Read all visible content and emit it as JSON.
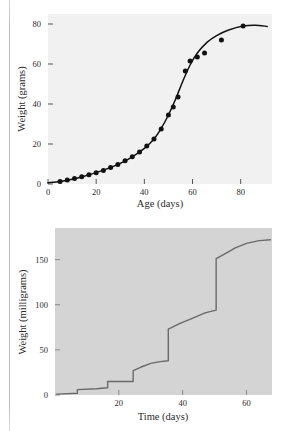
{
  "figure": {
    "caption": "",
    "panels": [
      {
        "id": "top",
        "name": "growth-curve-panel"
      },
      {
        "id": "bottom",
        "name": "molt-step-curve-panel"
      }
    ]
  },
  "chart_data": [
    {
      "type": "scatter",
      "name": "sigmoid-growth-curve",
      "title": "",
      "xlabel": "Age (days)",
      "ylabel": "Weight (grams)",
      "xlim": [
        0,
        93
      ],
      "ylim": [
        0,
        85
      ],
      "xticks": [
        0,
        20,
        40,
        60,
        80
      ],
      "xticklabels": [
        "0",
        "20",
        "40",
        "60",
        "80"
      ],
      "yticks": [
        0,
        20,
        40,
        60,
        80
      ],
      "yticklabels": [
        "0",
        "20",
        "40",
        "60",
        "80"
      ],
      "grid": false,
      "legend": "none",
      "background": "#f1f1f1",
      "line_color": "#111111",
      "marker_color": "#111111",
      "marker": "filled-circle",
      "points": [
        {
          "x": 5,
          "y": 1.2
        },
        {
          "x": 8,
          "y": 2.0
        },
        {
          "x": 11,
          "y": 2.8
        },
        {
          "x": 14,
          "y": 3.6
        },
        {
          "x": 17,
          "y": 4.6
        },
        {
          "x": 20,
          "y": 5.6
        },
        {
          "x": 23,
          "y": 6.8
        },
        {
          "x": 26,
          "y": 8.2
        },
        {
          "x": 29,
          "y": 9.8
        },
        {
          "x": 32,
          "y": 11.6
        },
        {
          "x": 35,
          "y": 13.6
        },
        {
          "x": 38,
          "y": 16.0
        },
        {
          "x": 41,
          "y": 19.0
        },
        {
          "x": 44,
          "y": 22.5
        },
        {
          "x": 47,
          "y": 27.5
        },
        {
          "x": 50,
          "y": 34.5
        },
        {
          "x": 52,
          "y": 38.5
        },
        {
          "x": 54,
          "y": 43.5
        },
        {
          "x": 57,
          "y": 56.5
        },
        {
          "x": 59,
          "y": 61.5
        },
        {
          "x": 62,
          "y": 63.5
        },
        {
          "x": 65,
          "y": 65.5
        },
        {
          "x": 72,
          "y": 72.0
        },
        {
          "x": 81,
          "y": 79.0
        }
      ],
      "fit_curve": [
        {
          "x": 0,
          "y": 0.6
        },
        {
          "x": 5,
          "y": 1.3
        },
        {
          "x": 10,
          "y": 2.4
        },
        {
          "x": 15,
          "y": 3.9
        },
        {
          "x": 20,
          "y": 5.7
        },
        {
          "x": 25,
          "y": 7.8
        },
        {
          "x": 30,
          "y": 10.3
        },
        {
          "x": 35,
          "y": 13.6
        },
        {
          "x": 40,
          "y": 17.8
        },
        {
          "x": 44,
          "y": 22.5
        },
        {
          "x": 47,
          "y": 27.8
        },
        {
          "x": 50,
          "y": 34.5
        },
        {
          "x": 53,
          "y": 42.5
        },
        {
          "x": 56,
          "y": 51.5
        },
        {
          "x": 59,
          "y": 59.5
        },
        {
          "x": 62,
          "y": 65.5
        },
        {
          "x": 66,
          "y": 70.8
        },
        {
          "x": 70,
          "y": 74.2
        },
        {
          "x": 75,
          "y": 77.0
        },
        {
          "x": 81,
          "y": 79.0
        },
        {
          "x": 86,
          "y": 79.4
        },
        {
          "x": 91,
          "y": 78.8
        }
      ]
    },
    {
      "type": "line",
      "name": "stepwise-molt-growth-curve",
      "title": "",
      "xlabel": "Time (days)",
      "ylabel": "Weight (milligrams)",
      "xlim": [
        0,
        68
      ],
      "ylim": [
        0,
        185
      ],
      "xticks": [
        20,
        40,
        60
      ],
      "xticklabels": [
        "20",
        "40",
        "60"
      ],
      "yticks": [
        0,
        50,
        100,
        150
      ],
      "yticklabels": [
        "0",
        "50",
        "100",
        "150"
      ],
      "grid": false,
      "legend": "none",
      "background": "#d4d4d4",
      "line_color": "#6a6a6a",
      "step_points": [
        {
          "x": 0.5,
          "y": 1
        },
        {
          "x": 7.0,
          "y": 2
        },
        {
          "x": 7.0,
          "y": 6
        },
        {
          "x": 13.0,
          "y": 7
        },
        {
          "x": 16.5,
          "y": 8
        },
        {
          "x": 16.5,
          "y": 15
        },
        {
          "x": 24.5,
          "y": 15
        },
        {
          "x": 24.5,
          "y": 27
        },
        {
          "x": 27.0,
          "y": 31
        },
        {
          "x": 30.0,
          "y": 35
        },
        {
          "x": 33.0,
          "y": 37
        },
        {
          "x": 35.5,
          "y": 38
        },
        {
          "x": 35.5,
          "y": 73
        },
        {
          "x": 39.0,
          "y": 79
        },
        {
          "x": 43.0,
          "y": 85
        },
        {
          "x": 47.0,
          "y": 91
        },
        {
          "x": 50.5,
          "y": 94
        },
        {
          "x": 50.5,
          "y": 151
        },
        {
          "x": 53.5,
          "y": 157
        },
        {
          "x": 56.5,
          "y": 163
        },
        {
          "x": 60.0,
          "y": 168
        },
        {
          "x": 64.0,
          "y": 171
        },
        {
          "x": 67.5,
          "y": 172
        }
      ]
    }
  ]
}
